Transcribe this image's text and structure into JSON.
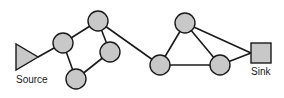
{
  "diagram": {
    "type": "flow-network",
    "colors": {
      "node_fill": "#c8c8c8",
      "stroke": "#1a1a1a",
      "background": "#ffffff"
    },
    "source": {
      "id": "source",
      "label": "Source",
      "shape": "triangle",
      "tip": [
        38,
        57
      ]
    },
    "sink": {
      "id": "sink",
      "label": "Sink",
      "shape": "square",
      "x": 250,
      "y": 43,
      "size": 20
    },
    "nodes": [
      {
        "id": "n1",
        "cx": 63,
        "cy": 43
      },
      {
        "id": "n2",
        "cx": 98,
        "cy": 21
      },
      {
        "id": "n3",
        "cx": 110,
        "cy": 52
      },
      {
        "id": "n4",
        "cx": 76,
        "cy": 79
      },
      {
        "id": "n5",
        "cx": 160,
        "cy": 65
      },
      {
        "id": "n6",
        "cx": 185,
        "cy": 23
      },
      {
        "id": "n7",
        "cx": 220,
        "cy": 65
      }
    ],
    "edges": [
      [
        "source",
        "n1"
      ],
      [
        "n1",
        "n2"
      ],
      [
        "n1",
        "n4"
      ],
      [
        "n2",
        "n3"
      ],
      [
        "n3",
        "n4"
      ],
      [
        "n2",
        "n5"
      ],
      [
        "n5",
        "n6"
      ],
      [
        "n5",
        "n7"
      ],
      [
        "n6",
        "n7"
      ],
      [
        "n6",
        "sink"
      ],
      [
        "n7",
        "sink"
      ]
    ]
  }
}
